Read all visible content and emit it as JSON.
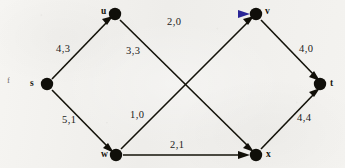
{
  "figure": {
    "type": "flow-network",
    "background_color": "#f3f2ef",
    "ink_color": "#131209",
    "corner_label": "f"
  },
  "nodes": [
    {
      "id": "s",
      "label": "s",
      "x": 47,
      "y": 84,
      "label_x": 30,
      "label_y": 79
    },
    {
      "id": "u",
      "label": "u",
      "x": 115,
      "y": 14,
      "label_x": 101,
      "label_y": 7
    },
    {
      "id": "w",
      "label": "w",
      "x": 116,
      "y": 155,
      "label_x": 101,
      "label_y": 150
    },
    {
      "id": "v",
      "label": "v",
      "x": 256,
      "y": 14,
      "label_x": 265,
      "label_y": 7
    },
    {
      "id": "x",
      "label": "x",
      "x": 256,
      "y": 155,
      "label_x": 266,
      "label_y": 150
    },
    {
      "id": "t",
      "label": "t",
      "x": 320,
      "y": 84,
      "label_x": 330,
      "label_y": 79
    }
  ],
  "edges": [
    {
      "id": "s-u",
      "from": "s",
      "to": "u",
      "label": "4,3",
      "capacity": 4,
      "flow": 3,
      "label_x": 56,
      "label_y": 44,
      "color": "#131209",
      "gradient": false
    },
    {
      "id": "s-w",
      "from": "s",
      "to": "w",
      "label": "5,1",
      "capacity": 5,
      "flow": 1,
      "label_x": 62,
      "label_y": 115,
      "color": "#131209",
      "gradient": false
    },
    {
      "id": "u-v",
      "from": "u",
      "to": "v",
      "label": "2,0",
      "capacity": 2,
      "flow": 0,
      "label_x": 167,
      "label_y": 17,
      "color": "#6b6a22",
      "gradient": true,
      "gradient_from": "#6e6d20",
      "gradient_to": "#3a34d6"
    },
    {
      "id": "u-x",
      "from": "u",
      "to": "x",
      "label": "3,3",
      "capacity": 3,
      "flow": 3,
      "label_x": 126,
      "label_y": 46,
      "color": "#131209",
      "gradient": false
    },
    {
      "id": "w-v",
      "from": "w",
      "to": "v",
      "label": "1,0",
      "capacity": 1,
      "flow": 0,
      "label_x": 130,
      "label_y": 110,
      "color": "#131209",
      "gradient": false
    },
    {
      "id": "w-x",
      "from": "w",
      "to": "x",
      "label": "2,1",
      "capacity": 2,
      "flow": 1,
      "label_x": 170,
      "label_y": 140,
      "color": "#131209",
      "gradient": false
    },
    {
      "id": "v-t",
      "from": "v",
      "to": "t",
      "label": "4,0",
      "capacity": 4,
      "flow": 0,
      "label_x": 299,
      "label_y": 44,
      "color": "#131209",
      "gradient": false
    },
    {
      "id": "x-t",
      "from": "x",
      "to": "t",
      "label": "4,4",
      "capacity": 4,
      "flow": 4,
      "label_x": 297,
      "label_y": 113,
      "color": "#131209",
      "gradient": false
    }
  ]
}
